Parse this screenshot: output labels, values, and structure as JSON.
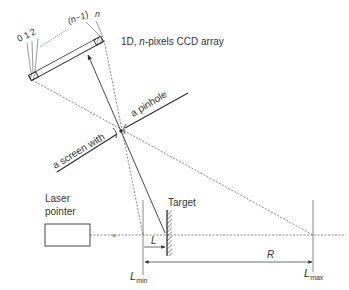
{
  "diagram": {
    "labels": {
      "ccd_array": "1D, n-pixels CCD array",
      "ccd_array_prefix": "1D, ",
      "ccd_array_n": "n",
      "ccd_array_suffix": "-pixels CCD array",
      "pixel_0": "0",
      "pixel_1": "1",
      "pixel_2": "2",
      "pixel_n_minus_1": "(n−1)",
      "pixel_n": "n",
      "screen_part1": "a screen with",
      "screen_part2": "a pinhole",
      "laser_line1": "Laser",
      "laser_line2": "pointer",
      "target": "Target",
      "L": "L",
      "R": "R",
      "Lmin_main": "L",
      "Lmin_sub": "min",
      "Lmax_main": "L",
      "Lmax_sub": "max"
    },
    "colors": {
      "stroke": "#333333",
      "dashed": "#555555",
      "background": "#ffffff"
    }
  }
}
